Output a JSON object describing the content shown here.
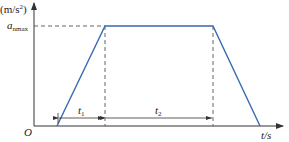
{
  "diagram": {
    "type": "trapezoidal acceleration-time profile",
    "y_axis_unit": "(m/s",
    "y_axis_unit_sup": "2",
    "y_axis_unit_close": ")",
    "y_level_label": "a",
    "y_level_sub": "nmax",
    "origin_label": "O",
    "x_axis_label": "t/s",
    "interval_1_label": "t",
    "interval_1_sub": "1",
    "interval_2_label": "t",
    "interval_2_sub": "2",
    "colors": {
      "curve": "#3a6ab0",
      "axes": "#333333",
      "dashed": "#555555"
    }
  }
}
